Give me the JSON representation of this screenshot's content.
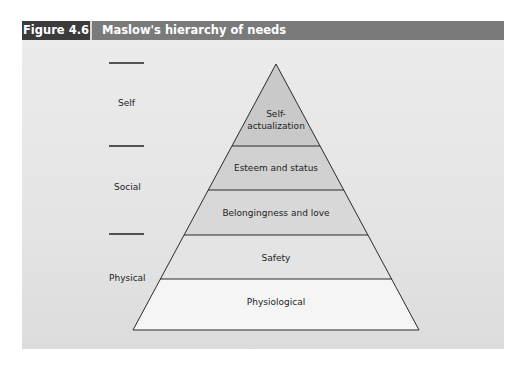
{
  "figure": {
    "number_label": "Figure 4.6",
    "title": "Maslow's hierarchy of needs"
  },
  "side_groups": [
    {
      "label": "Self"
    },
    {
      "label": "Social"
    },
    {
      "label": "Physical"
    }
  ],
  "pyramid": {
    "tiers_top_to_bottom": [
      {
        "label_line1": "Self-",
        "label_line2": "actualization",
        "fill": "#c9c9c9"
      },
      {
        "label": "Esteem and status",
        "fill": "#d1d1d1"
      },
      {
        "label": "Belongingness and love",
        "fill": "#d8d8d8"
      },
      {
        "label": "Safety",
        "fill": "#e4e4e4"
      },
      {
        "label": "Physiological",
        "fill": "#f4f4f4"
      }
    ]
  },
  "colors": {
    "header_label_bg": "#3b3b3b",
    "header_title_bg": "#7a7a7a",
    "panel_bg": "#e6e6e6",
    "outline": "#2a2a2a"
  }
}
